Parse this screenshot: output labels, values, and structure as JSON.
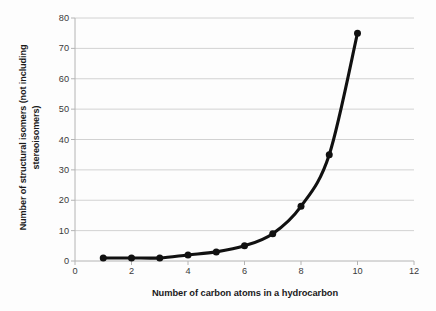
{
  "chart_data": {
    "type": "line",
    "title": "",
    "xlabel": "Number of carbon atoms in a hydrocarbon",
    "ylabel_line1": "Number of structural isomers (not including",
    "ylabel_line2": "stereoisomers)",
    "ylabel": "Number of structural isomers (not including stereoisomers)",
    "x": [
      1,
      2,
      3,
      4,
      5,
      6,
      7,
      8,
      9,
      10
    ],
    "values": [
      1,
      1,
      1,
      2,
      3,
      5,
      9,
      18,
      35,
      75
    ],
    "series": [
      {
        "name": "Structural isomers",
        "x": [
          1,
          2,
          3,
          4,
          5,
          6,
          7,
          8,
          9,
          10
        ],
        "values": [
          1,
          1,
          1,
          2,
          3,
          5,
          9,
          18,
          35,
          75
        ]
      }
    ],
    "xlim": [
      0,
      12
    ],
    "ylim": [
      0,
      80
    ],
    "xticks": [
      0,
      2,
      4,
      6,
      8,
      10,
      12
    ],
    "yticks": [
      0,
      10,
      20,
      30,
      40,
      50,
      60,
      70,
      80
    ],
    "xtick_labels": [
      "0",
      "2",
      "4",
      "6",
      "8",
      "10",
      "12"
    ],
    "ytick_labels": [
      "0",
      "10",
      "20",
      "30",
      "40",
      "50",
      "60",
      "70",
      "80"
    ],
    "grid": "horizontal",
    "legend": "none",
    "line_color": "#111111",
    "marker_color": "#111111",
    "grid_color": "#d2d2d2",
    "axis_color": "#b4b4b4",
    "background": "#ffffff"
  }
}
